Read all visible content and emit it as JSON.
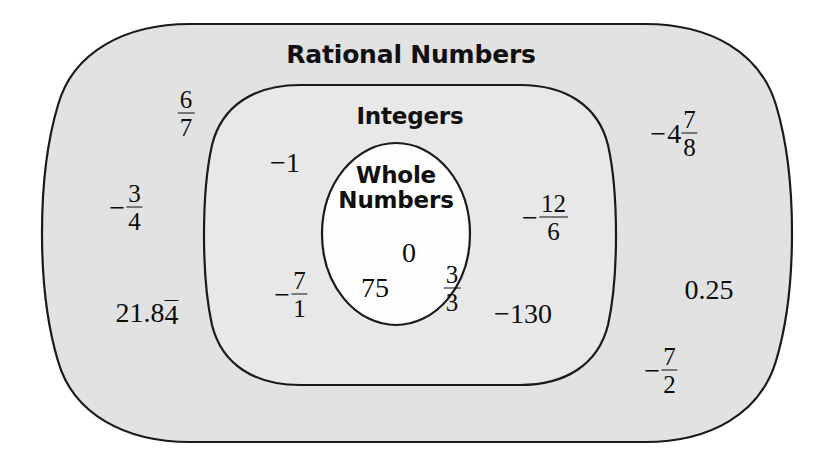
{
  "diagram": {
    "title": "Rational Numbers",
    "type": "nested-set-venn-diagram",
    "colors": {
      "outer_fill": "#e2e2e2",
      "middle_fill": "#e8e8e8",
      "inner_fill": "#fdfdfd",
      "stroke": "#1a1a1a",
      "text": "#0d0d0d",
      "background": "#ffffff"
    },
    "sets": {
      "outer": {
        "label": "Rational Numbers",
        "label_x": 411,
        "label_y": 54
      },
      "middle": {
        "label": "Integers",
        "label_x": 410,
        "label_y": 116
      },
      "inner": {
        "label_line1": "Whole",
        "label_line2": "Numbers",
        "label_x": 396,
        "label_y": 188
      }
    },
    "members": {
      "rational_only": [
        {
          "id": "six-sevenths",
          "kind": "fraction",
          "sign": "",
          "numerator": "6",
          "denominator": "7",
          "x": 186,
          "y": 113
        },
        {
          "id": "neg-three-fourths",
          "kind": "fraction",
          "sign": "−",
          "numerator": "3",
          "denominator": "4",
          "x": 126,
          "y": 207
        },
        {
          "id": "twenty-one-point-eight-four-repeating",
          "kind": "repeating-decimal",
          "prefix": "21.8",
          "repeating": "4",
          "x": 147,
          "y": 314
        },
        {
          "id": "neg-four-and-seven-eighths",
          "kind": "mixed-number",
          "sign": "−",
          "whole": "4",
          "numerator": "7",
          "denominator": "8",
          "x": 674,
          "y": 133
        },
        {
          "id": "zero-point-two-five",
          "kind": "decimal",
          "value": "0.25",
          "x": 709,
          "y": 290
        },
        {
          "id": "neg-seven-halves",
          "kind": "fraction",
          "sign": "−",
          "numerator": "7",
          "denominator": "2",
          "x": 661,
          "y": 370
        }
      ],
      "integers_only": [
        {
          "id": "neg-one",
          "kind": "integer",
          "value": "−1",
          "x": 285,
          "y": 163
        },
        {
          "id": "neg-twelve-sixths",
          "kind": "fraction",
          "sign": "−",
          "numerator": "12",
          "denominator": "6",
          "x": 545,
          "y": 217
        },
        {
          "id": "neg-seven-over-one",
          "kind": "fraction",
          "sign": "−",
          "numerator": "7",
          "denominator": "1",
          "x": 291,
          "y": 294
        },
        {
          "id": "neg-one-hundred-thirty",
          "kind": "integer",
          "value": "−130",
          "x": 523,
          "y": 314
        }
      ],
      "whole_numbers": [
        {
          "id": "zero",
          "kind": "integer",
          "value": "0",
          "x": 409,
          "y": 253
        },
        {
          "id": "seventy-five",
          "kind": "integer",
          "value": "75",
          "x": 375,
          "y": 288
        },
        {
          "id": "three-thirds",
          "kind": "fraction",
          "sign": "",
          "numerator": "3",
          "denominator": "3",
          "x": 452,
          "y": 288
        }
      ]
    }
  }
}
